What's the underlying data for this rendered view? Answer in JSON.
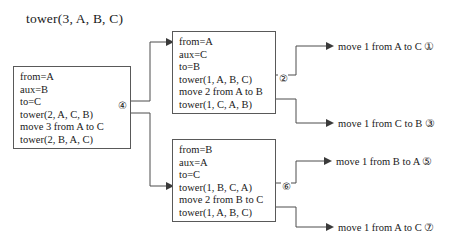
{
  "diagram": {
    "title": "tower(3, A, B, C)",
    "type": "recursion-trace",
    "boxes": [
      {
        "id": "root",
        "name": "root-call-box",
        "lines": [
          "from=A",
          "aux=B",
          "to=C",
          "tower(2, A, C, B)",
          "move 3 from A to C",
          "tower(2, B, A, C)"
        ]
      },
      {
        "id": "left",
        "name": "left-subcall-box",
        "lines": [
          "from=A",
          "aux=C",
          "to=B",
          "tower(1, A, B, C)",
          "move 2 from A to B",
          "tower(1, C, A, B)"
        ]
      },
      {
        "id": "right",
        "name": "right-subcall-box",
        "lines": [
          "from=B",
          "aux=A",
          "to=C",
          "tower(1, B, C, A)",
          "move 2 from B to C",
          "tower(1, A, B, C)"
        ]
      }
    ],
    "markers": {
      "root_move": "④",
      "left_move": "②",
      "right_move": "⑥"
    },
    "moves": [
      {
        "id": "move-1",
        "text": "move 1 from A to C ①"
      },
      {
        "id": "move-3",
        "text": "move 1 from C to B ③"
      },
      {
        "id": "move-5",
        "text": "move 1 from B to A ⑤"
      },
      {
        "id": "move-7",
        "text": "move 1 from A to C ⑦"
      }
    ]
  }
}
